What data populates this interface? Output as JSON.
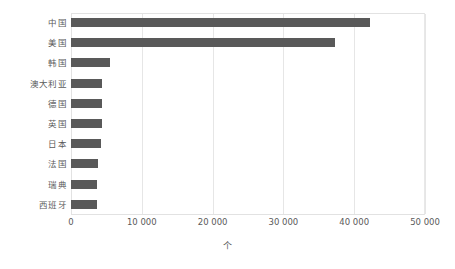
{
  "chart_data": {
    "type": "bar",
    "orientation": "horizontal",
    "title": "",
    "subtitle": "",
    "xlabel": "个",
    "ylabel": "",
    "categories": [
      "中国",
      "美国",
      "韩国",
      "澳大利亚",
      "德国",
      "英国",
      "日本",
      "法国",
      "瑞典",
      "西班牙"
    ],
    "values": [
      42200,
      37300,
      5500,
      4400,
      4400,
      4400,
      4200,
      3800,
      3700,
      3700
    ],
    "xlim": [
      0,
      50000
    ],
    "xtick_values": [
      0,
      10000,
      20000,
      30000,
      40000,
      50000
    ],
    "xtick_labels": [
      "0",
      "10 000",
      "20 000",
      "30 000",
      "40 000",
      "50 000"
    ],
    "grid": "vertical",
    "legend": "none",
    "bar_color": "#595959",
    "gridline_color": "#e6e6e6",
    "plot_border_color": "#e2e2e2"
  }
}
